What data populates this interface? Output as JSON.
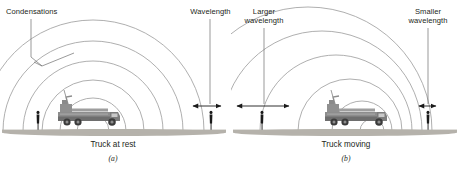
{
  "figure": {
    "colors": {
      "wavefront": "#9a9a9a",
      "leader": "#6f6f6f",
      "arrow": "#1a1a1a",
      "ground": "#b5b2ab",
      "truck_body": "#8d8d8d",
      "truck_dark": "#4f4f4f",
      "person": "#1a1a1a",
      "text": "#231f20",
      "background": "#ffffff"
    }
  },
  "panels": [
    {
      "id": "a",
      "letter": "(a)",
      "caption": "Truck at rest",
      "labels": [
        {
          "name": "condensations",
          "text": "Condensations"
        },
        {
          "name": "wavelength",
          "text": "Wavelength"
        }
      ],
      "wavefronts": {
        "center_x": 93,
        "center_y": 131,
        "radii": [
          16,
          33,
          51,
          70,
          90,
          111
        ]
      },
      "observers": [
        {
          "name": "left-observer",
          "x": 38
        },
        {
          "name": "right-observer",
          "x": 211
        }
      ],
      "truck": {
        "x": 93,
        "y": 131
      },
      "measure": {
        "name": "wavelength-span",
        "x1": 192,
        "x2": 222,
        "y": 106
      }
    },
    {
      "id": "b",
      "letter": "(b)",
      "caption": "Truck moving",
      "labels": [
        {
          "name": "larger-wavelength",
          "line1": "Larger",
          "line2": "wavelength"
        },
        {
          "name": "smaller-wavelength",
          "line1": "Smaller",
          "line2": "wavelength"
        }
      ],
      "wavefronts": {
        "center_y": 131,
        "circles": [
          {
            "cx": 372,
            "r": 12
          },
          {
            "cx": 362,
            "r": 30
          },
          {
            "cx": 350,
            "r": 52
          },
          {
            "cx": 336,
            "r": 76
          },
          {
            "cx": 322,
            "r": 100
          },
          {
            "cx": 308,
            "r": 124
          }
        ]
      },
      "observers": [
        {
          "name": "left-observer",
          "x": 262
        },
        {
          "name": "right-observer",
          "x": 428
        }
      ],
      "truck": {
        "x": 372,
        "y": 131
      },
      "measures": [
        {
          "name": "larger-wavelength-span",
          "x1": 236,
          "x2": 290,
          "y": 106
        },
        {
          "name": "smaller-wavelength-span",
          "x1": 418,
          "x2": 437,
          "y": 106
        }
      ]
    }
  ]
}
